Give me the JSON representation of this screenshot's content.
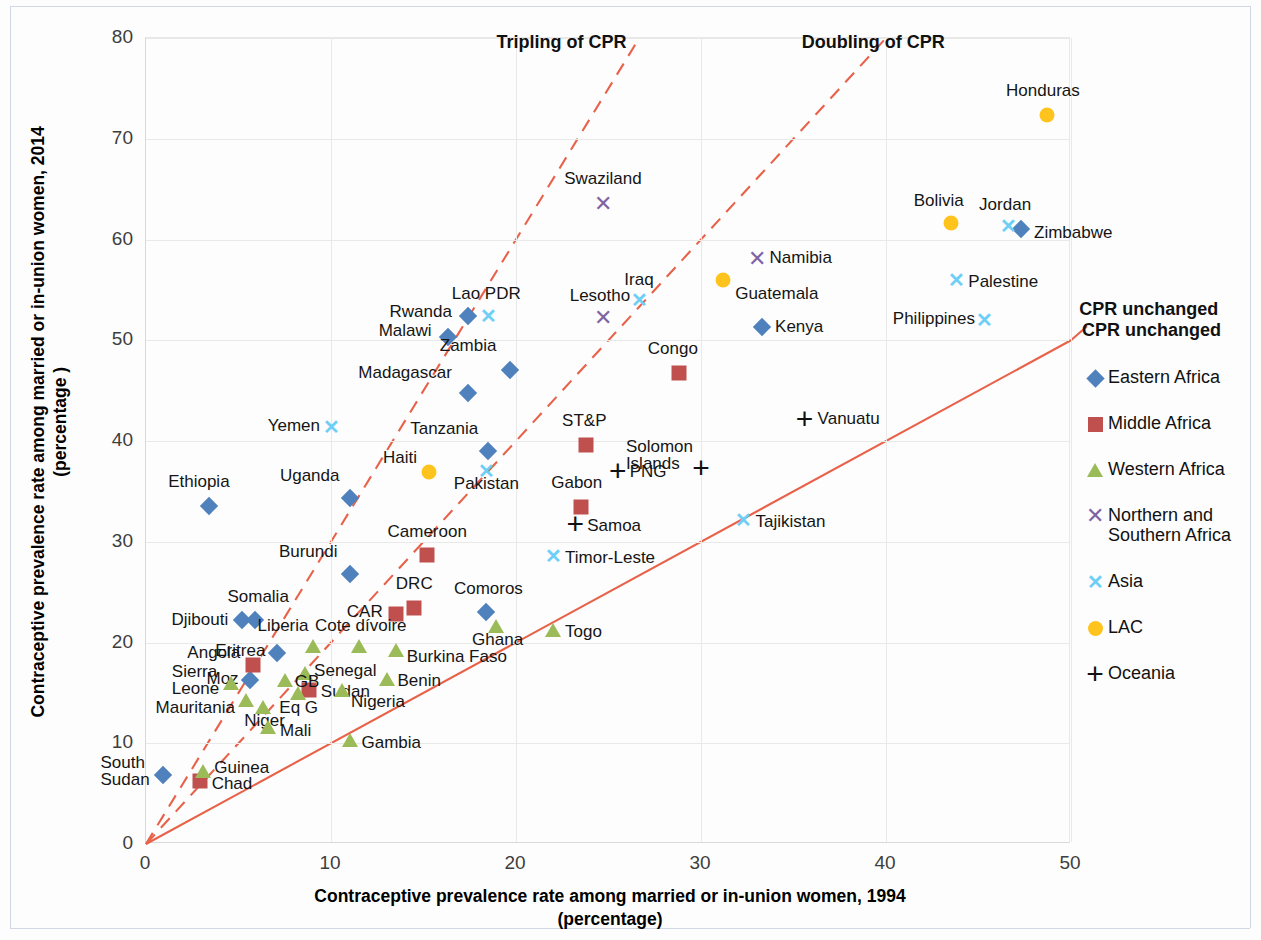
{
  "chart_data": {
    "type": "scatter",
    "title": "",
    "xlabel": "Contraceptive prevalence rate among married or in-union women, 1994 (percentage)",
    "ylabel": "Contraceptive prevalence rate among married or in-union women, 2014 (percentage )",
    "xlim": [
      0,
      50
    ],
    "ylim": [
      0,
      80
    ],
    "xticks": [
      "0",
      "10",
      "20",
      "30",
      "40",
      "50"
    ],
    "yticks": [
      "0",
      "10",
      "20",
      "30",
      "40",
      "50",
      "60",
      "70",
      "80"
    ],
    "grid": true,
    "legend_position": "right",
    "annotations": [
      {
        "text": "Tripling of CPR",
        "x": 19.0,
        "y": 79.5
      },
      {
        "text": "Doubling of CPR",
        "x": 35.5,
        "y": 79.5
      },
      {
        "text": "CPR unchanged",
        "x": 50.5,
        "y": 53.0
      }
    ],
    "reference_lines": [
      {
        "name": "CPR unchanged",
        "slope": 1,
        "style": "solid",
        "color": "#e8624a"
      },
      {
        "name": "Doubling of CPR",
        "slope": 2,
        "style": "dashed",
        "color": "#e8624a"
      },
      {
        "name": "Tripling of CPR",
        "slope": 3,
        "style": "dashed",
        "color": "#e8624a"
      }
    ],
    "series": [
      {
        "name": "Eastern Africa",
        "marker": "diamond",
        "color": "#4f81bd",
        "points": [
          {
            "label": "Ethiopia",
            "x": 3.4,
            "y": 33.5,
            "lx": -10,
            "ly": -24,
            "align": "c"
          },
          {
            "label": "Rwanda",
            "x": 17.4,
            "y": 52.4,
            "lx": -16,
            "ly": -4,
            "align": "r"
          },
          {
            "label": "Malawi",
            "x": 16.3,
            "y": 50.3,
            "lx": -16,
            "ly": -6,
            "align": "r"
          },
          {
            "label": "Madagascar",
            "x": 17.4,
            "y": 44.8,
            "lx": -16,
            "ly": -20,
            "align": "r"
          },
          {
            "label": "Zambia",
            "x": 19.7,
            "y": 47.0,
            "lx": -14,
            "ly": -24,
            "align": "r"
          },
          {
            "label": "Tanzania",
            "x": 18.5,
            "y": 39.0,
            "lx": -10,
            "ly": -22,
            "align": "r"
          },
          {
            "label": "Uganda",
            "x": 11.0,
            "y": 34.3,
            "lx": -10,
            "ly": -22,
            "align": "r"
          },
          {
            "label": "Burundi",
            "x": 11.0,
            "y": 26.8,
            "lx": -12,
            "ly": -22,
            "align": "r"
          },
          {
            "label": "Comoros",
            "x": 18.4,
            "y": 23.0,
            "lx": 2,
            "ly": -23,
            "align": "c"
          },
          {
            "label": "Djibouti",
            "x": 5.2,
            "y": 22.2,
            "lx": -14,
            "ly": 0,
            "align": "r"
          },
          {
            "label": "Somalia",
            "x": 5.9,
            "y": 22.2,
            "lx": 3,
            "ly": -23,
            "align": "c"
          },
          {
            "label": "Eritrea",
            "x": 7.1,
            "y": 19.0,
            "lx": -12,
            "ly": -2,
            "align": "r"
          },
          {
            "label": "Moz",
            "x": 5.6,
            "y": 16.3,
            "lx": -11,
            "ly": -1,
            "align": "r"
          },
          {
            "label": "Kenya",
            "x": 33.3,
            "y": 51.3,
            "lx": 13,
            "ly": 0,
            "align": "l"
          },
          {
            "label": "Zimbabwe",
            "x": 47.3,
            "y": 61.0,
            "lx": 13,
            "ly": 4,
            "align": "l"
          },
          {
            "label": "South Sudan",
            "x": 0.9,
            "y": 6.8,
            "lx": -13,
            "ly": -1,
            "align": "r"
          }
        ]
      },
      {
        "name": "Middle Africa",
        "marker": "square",
        "color": "#c0504d",
        "points": [
          {
            "label": "Congo",
            "x": 28.8,
            "y": 46.7,
            "lx": -6,
            "ly": -24,
            "align": "c"
          },
          {
            "label": "ST&P",
            "x": 23.8,
            "y": 39.6,
            "lx": -2,
            "ly": -24,
            "align": "c"
          },
          {
            "label": "Gabon",
            "x": 23.5,
            "y": 33.4,
            "lx": -4,
            "ly": -24,
            "align": "c"
          },
          {
            "label": "Cameroon",
            "x": 15.2,
            "y": 28.7,
            "lx": 0,
            "ly": -23,
            "align": "c"
          },
          {
            "label": "DRC",
            "x": 14.5,
            "y": 23.4,
            "lx": 0,
            "ly": -24,
            "align": "c"
          },
          {
            "label": "CAR",
            "x": 13.5,
            "y": 22.8,
            "lx": -13,
            "ly": -2,
            "align": "r"
          },
          {
            "label": "Angola",
            "x": 5.8,
            "y": 17.8,
            "lx": -13,
            "ly": -12,
            "align": "r"
          },
          {
            "label": "Chad",
            "x": 2.9,
            "y": 6.3,
            "lx": 12,
            "ly": 3,
            "align": "l"
          },
          {
            "label": "Sudan",
            "x": 8.8,
            "y": 15.3,
            "lx": 12,
            "ly": 2,
            "align": "l"
          }
        ]
      },
      {
        "name": "Western Africa",
        "marker": "triangle",
        "color": "#9bbb59",
        "points": [
          {
            "label": "Ghana",
            "x": 18.9,
            "y": 21.6,
            "lx": 2,
            "ly": 14,
            "align": "c"
          },
          {
            "label": "Togo",
            "x": 22.0,
            "y": 21.2,
            "lx": 12,
            "ly": 2,
            "align": "l"
          },
          {
            "label": "Burkina Faso",
            "x": 13.5,
            "y": 19.3,
            "lx": 11,
            "ly": 7,
            "align": "l"
          },
          {
            "label": "Cote dívoire",
            "x": 11.5,
            "y": 19.7,
            "lx": 2,
            "ly": -20,
            "align": "c"
          },
          {
            "label": "Liberia",
            "x": 9.0,
            "y": 19.7,
            "lx": -4,
            "ly": -20,
            "align": "r"
          },
          {
            "label": "Benin",
            "x": 13.0,
            "y": 16.4,
            "lx": 11,
            "ly": 2,
            "align": "l"
          },
          {
            "label": "Senegal",
            "x": 8.6,
            "y": 17.0,
            "lx": 9,
            "ly": -2,
            "align": "l"
          },
          {
            "label": "GB",
            "x": 7.5,
            "y": 16.3,
            "lx": 10,
            "ly": 2,
            "align": "l"
          },
          {
            "label": "Nigeria",
            "x": 10.6,
            "y": 15.3,
            "lx": 9,
            "ly": 12,
            "align": "l"
          },
          {
            "label": "Sierra Leone",
            "x": 4.6,
            "y": 16.0,
            "lx": -12,
            "ly": 0,
            "align": "r"
          },
          {
            "label": "Mauritania",
            "x": 5.4,
            "y": 14.3,
            "lx": -11,
            "ly": 8,
            "align": "r"
          },
          {
            "label": "Niger",
            "x": 6.3,
            "y": 13.6,
            "lx": 2,
            "ly": 14,
            "align": "c"
          },
          {
            "label": "Mali",
            "x": 6.6,
            "y": 11.6,
            "lx": 12,
            "ly": 4,
            "align": "l"
          },
          {
            "label": "Gambia",
            "x": 11.0,
            "y": 10.3,
            "lx": 12,
            "ly": 3,
            "align": "l"
          },
          {
            "label": "Guinea",
            "x": 3.1,
            "y": 7.2,
            "lx": 11,
            "ly": -3,
            "align": "l"
          },
          {
            "label": "Eq G",
            "x": 8.2,
            "y": 15.0,
            "lx": 1,
            "ly": 15,
            "align": "c"
          }
        ]
      },
      {
        "name": "Northern and Southern Africa",
        "marker": "x",
        "color": "#8064a2",
        "points": [
          {
            "label": "Swaziland",
            "x": 24.7,
            "y": 63.5,
            "lx": 0,
            "ly": -25,
            "align": "c"
          },
          {
            "label": "Namibia",
            "x": 33.0,
            "y": 58.1,
            "lx": 13,
            "ly": -1,
            "align": "l"
          },
          {
            "label": "Lesotho",
            "x": 24.7,
            "y": 52.2,
            "lx": -3,
            "ly": -22,
            "align": "c"
          }
        ]
      },
      {
        "name": "Asia",
        "marker": "x-asia",
        "color": "#6ecff6",
        "points": [
          {
            "label": "Lao PDR",
            "x": 18.5,
            "y": 52.4,
            "lx": -2,
            "ly": -22,
            "align": "c"
          },
          {
            "label": "Iraq",
            "x": 26.7,
            "y": 54.0,
            "lx": -1,
            "ly": -20,
            "align": "c"
          },
          {
            "label": "Palestine",
            "x": 43.8,
            "y": 56.0,
            "lx": 12,
            "ly": 2,
            "align": "l"
          },
          {
            "label": "Philippines",
            "x": 45.3,
            "y": 52.0,
            "lx": -9,
            "ly": -1,
            "align": "r"
          },
          {
            "label": "Jordan",
            "x": 46.6,
            "y": 61.3,
            "lx": -3,
            "ly": -21,
            "align": "c"
          },
          {
            "label": "Yemen",
            "x": 10.0,
            "y": 41.4,
            "lx": -11,
            "ly": -1,
            "align": "r"
          },
          {
            "label": "Pakistan",
            "x": 18.4,
            "y": 37.0,
            "lx": 0,
            "ly": 13,
            "align": "c"
          },
          {
            "label": "Timor-Leste",
            "x": 22.0,
            "y": 28.6,
            "lx": 12,
            "ly": 2,
            "align": "l"
          },
          {
            "label": "Tajikistan",
            "x": 32.3,
            "y": 32.2,
            "lx": 12,
            "ly": 2,
            "align": "l"
          }
        ]
      },
      {
        "name": "LAC",
        "marker": "circle",
        "color": "#ffc31e",
        "points": [
          {
            "label": "Honduras",
            "x": 48.7,
            "y": 72.4,
            "lx": -4,
            "ly": -24,
            "align": "c"
          },
          {
            "label": "Bolivia",
            "x": 43.5,
            "y": 61.6,
            "lx": -12,
            "ly": -22,
            "align": "c"
          },
          {
            "label": "Guatemala",
            "x": 31.2,
            "y": 56.0,
            "lx": 12,
            "ly": 14,
            "align": "l"
          },
          {
            "label": "Haiti",
            "x": 15.3,
            "y": 36.9,
            "lx": -12,
            "ly": -14,
            "align": "r"
          }
        ]
      },
      {
        "name": "Oceania",
        "marker": "plus",
        "color": "#111111",
        "points": [
          {
            "label": "Vanuatu",
            "x": 35.6,
            "y": 42.2,
            "lx": 13,
            "ly": 0,
            "align": "l"
          },
          {
            "label": "Solomon Islands",
            "x": 30.0,
            "y": 37.3,
            "lx": -8,
            "ly": -8,
            "align": "r"
          },
          {
            "label": "PNG",
            "x": 25.5,
            "y": 37.0,
            "lx": 12,
            "ly": 1,
            "align": "l"
          },
          {
            "label": "Samoa",
            "x": 23.2,
            "y": 31.8,
            "lx": 12,
            "ly": 2,
            "align": "l"
          }
        ]
      }
    ]
  },
  "legend": {
    "title": "CPR unchanged",
    "items": [
      {
        "label": "Eastern Africa",
        "marker": "diamond",
        "color": "#4f81bd"
      },
      {
        "label": "Middle Africa",
        "marker": "square",
        "color": "#c0504d"
      },
      {
        "label": "Western Africa",
        "marker": "triangle",
        "color": "#9bbb59"
      },
      {
        "label": "Northern and Southern Africa",
        "marker": "x",
        "color": "#8064a2"
      },
      {
        "label": "Asia",
        "marker": "x-asia",
        "color": "#6ecff6"
      },
      {
        "label": "LAC",
        "marker": "circle",
        "color": "#ffc31e"
      },
      {
        "label": "Oceania",
        "marker": "plus",
        "color": "#111111"
      }
    ]
  },
  "axis_titles": {
    "x_line1": "Contraceptive prevalence rate among married or in-union women, 1994",
    "x_line2": "(percentage)",
    "y_line1": "Contraceptive prevalence rate among married or in-union women, 2014",
    "y_line2": "(percentage )"
  }
}
